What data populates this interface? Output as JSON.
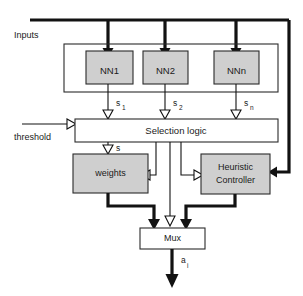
{
  "diagram": {
    "type": "block-diagram",
    "colors": {
      "shaded_block_fill": "#cfcfcf",
      "plain_block_fill": "#ffffff",
      "stroke": "#2b2b2b",
      "wire": "#121212",
      "background": "#ffffff"
    },
    "free_labels": {
      "inputs": "Inputs",
      "threshold": "threshold"
    },
    "blocks": {
      "nn1": "NN1",
      "nn2": "NN2",
      "nnn": "NNn",
      "selection_logic": "Selection logic",
      "weights": "weights",
      "heuristic_controller_line1": "Heuristic",
      "heuristic_controller_line2": "Controller",
      "mux": "Mux"
    },
    "signals": {
      "s1_base": "s",
      "s1_sub": "1",
      "s2_base": "s",
      "s2_sub": "2",
      "sn_base": "s",
      "sn_sub": "n",
      "s_single": "s",
      "out_base": "a",
      "out_sub": "i"
    }
  }
}
